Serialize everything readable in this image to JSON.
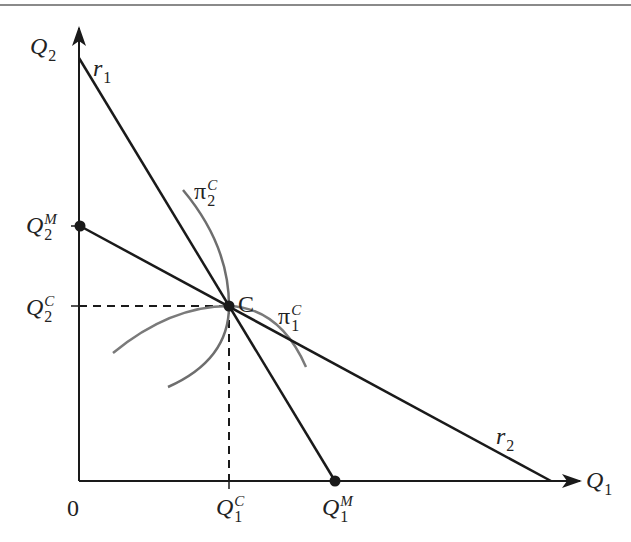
{
  "figure": {
    "type": "cournot-reaction-function-diagram",
    "axes": {
      "x": {
        "label": "Q",
        "subscript": "1"
      },
      "y": {
        "label": "Q",
        "subscript": "2"
      },
      "origin_label": "0"
    },
    "lines": {
      "r1": {
        "label": "r",
        "subscript": "1"
      },
      "r2": {
        "label": "r",
        "subscript": "2"
      }
    },
    "curves": {
      "pi1": {
        "label": "π",
        "superscript": "C",
        "subscript": "1"
      },
      "pi2": {
        "label": "π",
        "superscript": "C",
        "subscript": "2"
      }
    },
    "points": {
      "C": {
        "label": "C"
      }
    },
    "ticks": {
      "q2m": {
        "label": "Q",
        "superscript": "M",
        "subscript": "2"
      },
      "q2c": {
        "label": "Q",
        "superscript": "C",
        "subscript": "2"
      },
      "q1c": {
        "label": "Q",
        "superscript": "C",
        "subscript": "1"
      },
      "q1m": {
        "label": "Q",
        "superscript": "M",
        "subscript": "1"
      }
    },
    "colors": {
      "line": "#1a1a1a",
      "curve": "#7a7a7a",
      "rule": "#8a8a8a"
    }
  }
}
